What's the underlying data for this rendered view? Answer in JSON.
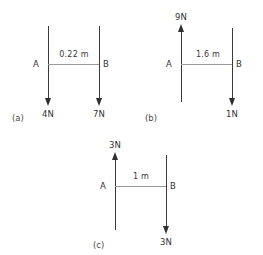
{
  "figure": {
    "line_color": "#3a3a3a",
    "dim_line_color": "#9a9a9a",
    "text_color": "#333333",
    "background": "#ffffff"
  },
  "panels": [
    {
      "id": "a",
      "caption": "(a)",
      "dimension": "0.22 m",
      "left": {
        "point_label": "A",
        "force_label": "4N",
        "direction": "down"
      },
      "right": {
        "point_label": "B",
        "force_label": "7N",
        "direction": "down"
      }
    },
    {
      "id": "b",
      "caption": "(b)",
      "dimension": "1.6 m",
      "left": {
        "point_label": "A",
        "force_label": "9N",
        "direction": "up"
      },
      "right": {
        "point_label": "B",
        "force_label": "1N",
        "direction": "down"
      }
    },
    {
      "id": "c",
      "caption": "(c)",
      "dimension": "1 m",
      "left": {
        "point_label": "A",
        "force_label": "3N",
        "direction": "up"
      },
      "right": {
        "point_label": "B",
        "force_label": "3N",
        "direction": "down"
      }
    }
  ]
}
